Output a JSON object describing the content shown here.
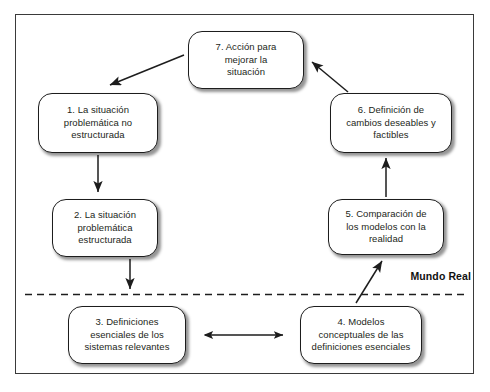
{
  "diagram": {
    "title_label": "Mundo Real",
    "divider": {
      "label": "Mundo Real",
      "style": "dashed"
    },
    "nodes": [
      {
        "id": "1",
        "text": "1. La situación problemática no estructurada",
        "lines": [
          "1. La situación",
          "problemática no",
          "estructurada"
        ]
      },
      {
        "id": "2",
        "text": "2. La situación problemática estructurada",
        "lines": [
          "2. La situación",
          "problemática",
          "estructurada"
        ]
      },
      {
        "id": "3",
        "text": "3. Definiciones esenciales de los sistemas relevantes",
        "lines": [
          "3. Definiciones",
          "esenciales de los",
          "sistemas relevantes"
        ]
      },
      {
        "id": "4",
        "text": "4. Modelos conceptuales de las definiciones esenciales",
        "lines": [
          "4. Modelos",
          "conceptuales de las",
          "definiciones esenciales"
        ]
      },
      {
        "id": "5",
        "text": "5. Comparación de los modelos con la realidad",
        "lines": [
          "5. Comparación de",
          "los modelos con la",
          "realidad"
        ]
      },
      {
        "id": "6",
        "text": "6. Definición de cambios deseables y factibles",
        "lines": [
          "6. Definición de",
          "cambios deseables y",
          "factibles"
        ]
      },
      {
        "id": "7",
        "text": "7. Acción para mejorar la situación",
        "lines": [
          "7. Acción para",
          "mejorar la",
          "situación"
        ]
      }
    ],
    "edges": [
      {
        "from": "7",
        "to": "1",
        "type": "arrow"
      },
      {
        "from": "1",
        "to": "2",
        "type": "arrow"
      },
      {
        "from": "2",
        "to": "3",
        "type": "arrow"
      },
      {
        "from": "3",
        "to": "4",
        "type": "double-arrow"
      },
      {
        "from": "4",
        "to": "5",
        "type": "arrow"
      },
      {
        "from": "5",
        "to": "6",
        "type": "arrow"
      },
      {
        "from": "6",
        "to": "7",
        "type": "arrow"
      }
    ],
    "colors": {
      "line": "#1d1d1d",
      "border": "#3a3a3a",
      "text": "#231f20",
      "background": "#ffffff"
    }
  }
}
